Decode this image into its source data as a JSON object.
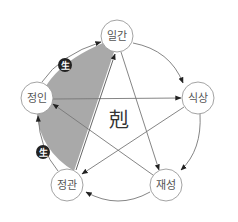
{
  "colors": {
    "shade": "#a9a9a9",
    "line": "#777777",
    "node_stroke": "#999999",
    "node_fill": "#ffffff",
    "badge_fill": "#222222"
  },
  "nodes": [
    {
      "id": "ilgan",
      "label": "일간",
      "cx": 117,
      "cy": 36
    },
    {
      "id": "siksang",
      "label": "식상",
      "cx": 198,
      "cy": 98
    },
    {
      "id": "jaeseong",
      "label": "재성",
      "cx": 166,
      "cy": 185
    },
    {
      "id": "jeonggwan",
      "label": "정관",
      "cx": 67,
      "cy": 185
    },
    {
      "id": "jeongin",
      "label": "정인",
      "cx": 37,
      "cy": 98
    }
  ],
  "center": {
    "label": "剋"
  },
  "badges": [
    {
      "label": "生",
      "cx": 65,
      "cy": 65
    },
    {
      "label": "生",
      "cx": 43,
      "cy": 152
    }
  ],
  "cycle_arrows": [
    {
      "from": "일간",
      "to": "식상"
    },
    {
      "from": "식상",
      "to": "재성"
    },
    {
      "from": "재성",
      "to": "정관"
    },
    {
      "from": "정관",
      "to": "정인",
      "relation": "生"
    },
    {
      "from": "정인",
      "to": "일간",
      "relation": "生"
    }
  ],
  "control_arrows": [
    {
      "from": "정인",
      "to": "식상"
    },
    {
      "from": "일간",
      "to": "재성"
    },
    {
      "from": "식상",
      "to": "정관"
    },
    {
      "from": "재성",
      "to": "정인"
    },
    {
      "from": "정관",
      "to": "일간"
    }
  ]
}
